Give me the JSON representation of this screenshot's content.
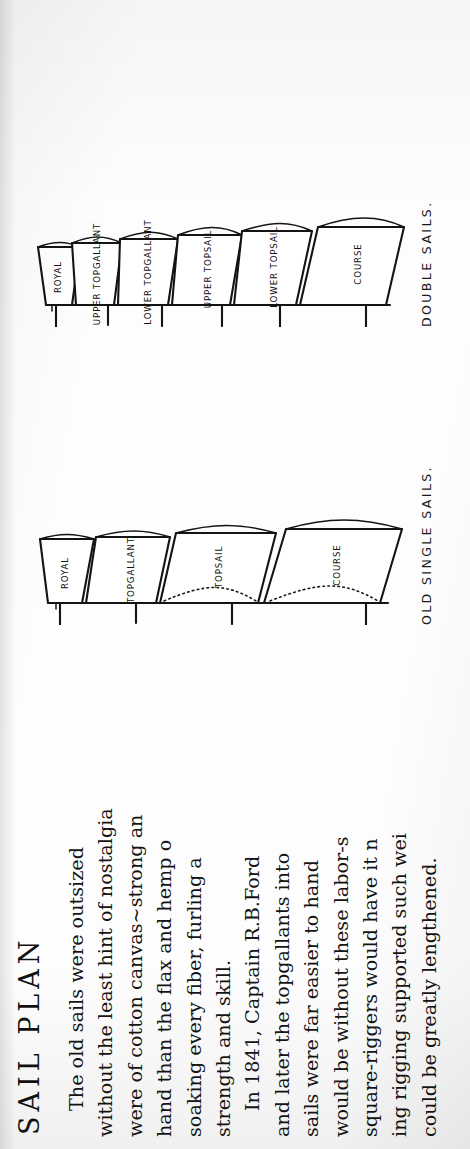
{
  "page": {
    "title": "SAIL PLAN",
    "orientation": "rotated-90-ccw",
    "background_color": "#fdfdfd",
    "ink_color": "#141414"
  },
  "body_text": {
    "paragraph_1": [
      "The old sails were outsized",
      "without the least hint of nostalgia",
      "were of cotton canvas~strong an",
      "hand than the flax and hemp o",
      "soaking every fiber, furling a",
      "strength and skill."
    ],
    "paragraph_2": [
      "In 1841, Captain R.B.Ford",
      "and later the topgallants into",
      "sails were far easier to hand",
      "would be without these labor-s",
      "square-riggers would have it n",
      "ing rigging supported such wei",
      "could be greatly lengthened."
    ]
  },
  "diagrams": [
    {
      "id": "old-single-sails",
      "caption": "OLD SINGLE SAILS.",
      "sails": [
        {
          "label": "ROYAL",
          "dotted_foot": false
        },
        {
          "label": "TOPGALLANT",
          "dotted_foot": false
        },
        {
          "label": "TOPSAIL",
          "dotted_foot": true
        },
        {
          "label": "COURSE",
          "dotted_foot": true
        }
      ]
    },
    {
      "id": "double-sails",
      "caption": "DOUBLE SAILS.",
      "sails": [
        {
          "label": "ROYAL",
          "dotted_foot": false
        },
        {
          "label": "UPPER TOPGALLANT",
          "dotted_foot": false
        },
        {
          "label": "LOWER TOPGALLANT",
          "dotted_foot": false
        },
        {
          "label": "UPPER TOPSAIL",
          "dotted_foot": false
        },
        {
          "label": "LOWER TOPSAIL",
          "dotted_foot": false
        },
        {
          "label": "COURSE",
          "dotted_foot": false
        }
      ]
    }
  ]
}
